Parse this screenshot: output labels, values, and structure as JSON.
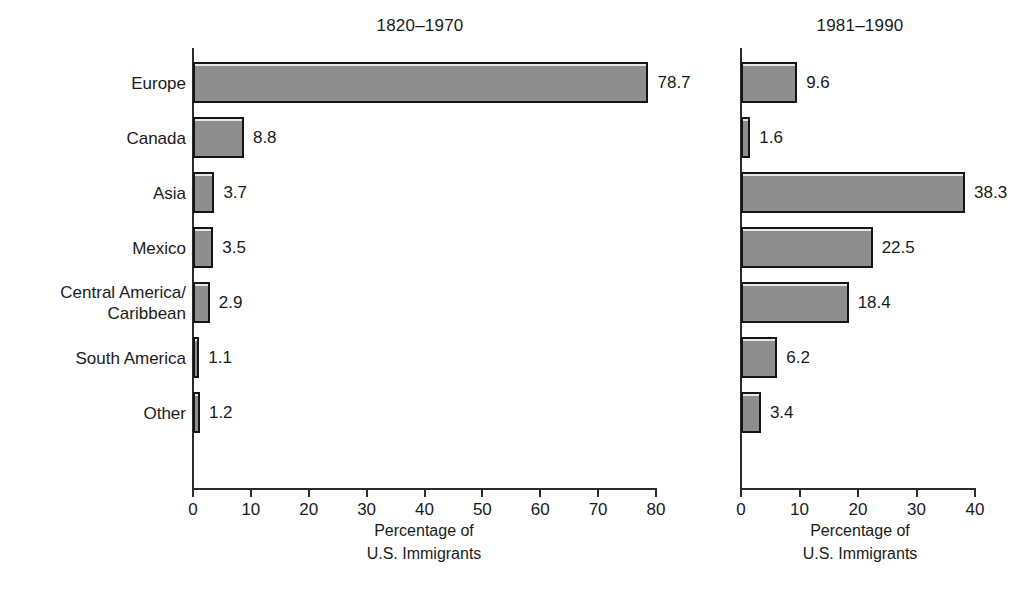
{
  "chart_data": {
    "type": "bar",
    "title": "",
    "orientation": "horizontal",
    "categories": [
      "Europe",
      "Canada",
      "Asia",
      "Mexico",
      "Central America/\nCaribbean",
      "South America",
      "Other"
    ],
    "xlabel": "Percentage of\nU.S. Immigrants",
    "ylabel": "",
    "grid": false,
    "legend": "none",
    "panels": [
      {
        "title": "1820–1970",
        "xlabel": "Percentage of\nU.S. Immigrants",
        "xlim": [
          0,
          80
        ],
        "xticks": [
          0,
          10,
          20,
          30,
          40,
          50,
          60,
          70,
          80
        ],
        "xtick_labels": [
          "0",
          "10",
          "20",
          "30",
          "40",
          "50",
          "60",
          "70",
          "80"
        ],
        "values": [
          78.7,
          8.8,
          3.7,
          3.5,
          2.9,
          1.1,
          1.2
        ],
        "value_labels": [
          "78.7",
          "8.8",
          "3.7",
          "3.5",
          "2.9",
          "1.1",
          "1.2"
        ]
      },
      {
        "title": "1981–1990",
        "xlabel": "Percentage of\nU.S. Immigrants",
        "xlim": [
          0,
          40
        ],
        "xticks": [
          0,
          10,
          20,
          30,
          40
        ],
        "xtick_labels": [
          "0",
          "10",
          "20",
          "30",
          "40"
        ],
        "values": [
          9.6,
          1.6,
          38.3,
          22.5,
          18.4,
          6.2,
          3.4
        ],
        "value_labels": [
          "9.6",
          "1.6",
          "38.3",
          "22.5",
          "18.4",
          "6.2",
          "3.4"
        ]
      }
    ],
    "colors": {
      "bar_fill": "#8e8e8e",
      "bar_border": "#141414",
      "axis": "#2b2b2b",
      "text": "#1a1a1a",
      "background": "#ffffff"
    }
  }
}
